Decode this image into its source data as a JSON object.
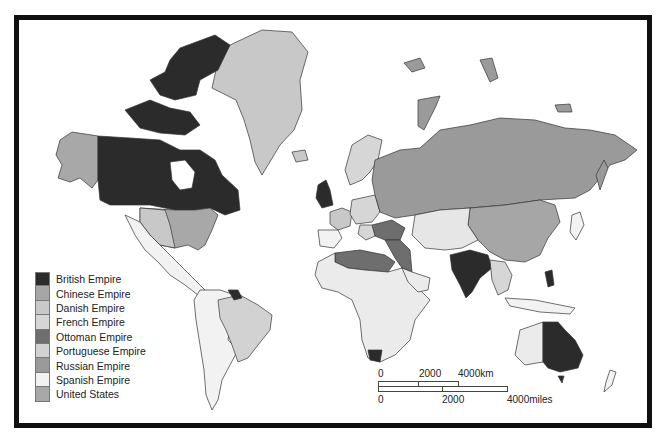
{
  "map": {
    "title": "World empires map",
    "legend": [
      {
        "label": "British Empire",
        "color": "#2b2b2b"
      },
      {
        "label": "Chinese Empire",
        "color": "#a6a6a6"
      },
      {
        "label": "Danish Empire",
        "color": "#c8c8c8"
      },
      {
        "label": "French Empire",
        "color": "#d6d6d6"
      },
      {
        "label": "Ottoman Empire",
        "color": "#6e6e6e"
      },
      {
        "label": "Portuguese Empire",
        "color": "#d2d2d2"
      },
      {
        "label": "Russian Empire",
        "color": "#9a9a9a"
      },
      {
        "label": "Spanish Empire",
        "color": "#f2f2f2"
      },
      {
        "label": "United States",
        "color": "#a8a8a8"
      }
    ],
    "scale_bar": {
      "km": {
        "ticks": [
          "0",
          "2000",
          "4000km"
        ]
      },
      "miles": {
        "ticks": [
          "0",
          "2000",
          "4000miles"
        ]
      }
    }
  }
}
